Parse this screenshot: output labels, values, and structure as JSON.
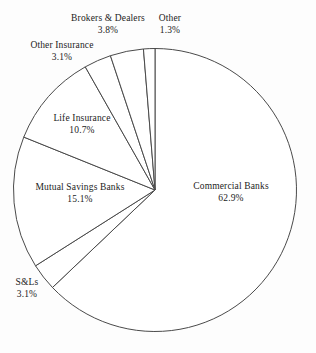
{
  "chart_data": {
    "type": "pie",
    "title": "",
    "subtitle": "",
    "xlabel": "",
    "ylabel": "",
    "legend_position": "none",
    "grid": false,
    "units": "percent",
    "start_angle_deg": 90,
    "direction": "clockwise",
    "categories": [
      "Commercial Banks",
      "S&Ls",
      "Mutual Savings Banks",
      "Life Insurance",
      "Other Insurance",
      "Brokers & Dealers",
      "Other"
    ],
    "values": [
      62.9,
      3.1,
      15.1,
      10.7,
      3.1,
      3.8,
      1.3
    ],
    "slices": [
      {
        "name": "Commercial Banks",
        "value": 62.9,
        "value_label": "62.9%",
        "label_placement": "inside",
        "fill": "#ffffff",
        "stroke": "#4a4a4a"
      },
      {
        "name": "S&Ls",
        "value": 3.1,
        "value_label": "3.1%",
        "label_placement": "outside",
        "fill": "#ffffff",
        "stroke": "#4a4a4a"
      },
      {
        "name": "Mutual Savings Banks",
        "value": 15.1,
        "value_label": "15.1%",
        "label_placement": "inside",
        "fill": "#ffffff",
        "stroke": "#4a4a4a"
      },
      {
        "name": "Life Insurance",
        "value": 10.7,
        "value_label": "10.7%",
        "label_placement": "inside",
        "fill": "#ffffff",
        "stroke": "#4a4a4a"
      },
      {
        "name": "Other Insurance",
        "value": 3.1,
        "value_label": "3.1%",
        "label_placement": "outside",
        "fill": "#ffffff",
        "stroke": "#4a4a4a"
      },
      {
        "name": "Brokers & Dealers",
        "value": 3.8,
        "value_label": "3.8%",
        "label_placement": "outside",
        "fill": "#ffffff",
        "stroke": "#4a4a4a"
      },
      {
        "name": "Other",
        "value": 1.3,
        "value_label": "1.3%",
        "label_placement": "outside",
        "fill": "#ffffff",
        "stroke": "#4a4a4a"
      }
    ]
  }
}
